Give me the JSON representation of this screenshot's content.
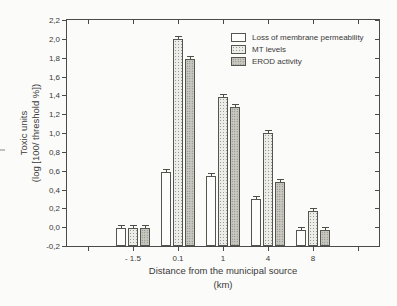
{
  "figure": {
    "background": "#fbfbf9",
    "axis_color": "#4a4a4a",
    "text_color": "#3a3a3a",
    "bar_colors": {
      "loss_membrane": "#fdfdfc",
      "mt_levels": "#ecece8",
      "erod": "#c9c9c2"
    }
  },
  "chart_data": {
    "type": "bar",
    "title": "",
    "categories": [
      "- 1.5",
      "0.1",
      "1",
      "4",
      "8"
    ],
    "series": [
      {
        "name": "Loss of membrane permeability",
        "values": [
          -0.01,
          0.59,
          0.54,
          0.3,
          -0.03
        ]
      },
      {
        "name": "MT levels",
        "values": [
          -0.01,
          2.0,
          1.38,
          1.0,
          0.17
        ]
      },
      {
        "name": "EROD activity",
        "values": [
          -0.01,
          1.79,
          1.28,
          0.48,
          -0.03
        ]
      }
    ],
    "error": 0.025,
    "xlabel": "Distance from the municipal source",
    "xlabel_unit": "(km)",
    "ylabel_line1": "Toxic units",
    "ylabel_line2": "(log [100/ threshold %])",
    "ylim": [
      -0.2,
      2.2
    ],
    "ytick_step": 0.2,
    "ytick_labels": [
      "-0,2",
      "0,0",
      "0,2",
      "0,4",
      "0,6",
      "0,8",
      "1,0",
      "1,2",
      "1,4",
      "1,6",
      "1,8",
      "2,0",
      "2,2"
    ],
    "grid": false,
    "bars_drawn_from_axis_floor": true,
    "legend_position": "top-center-inside"
  }
}
